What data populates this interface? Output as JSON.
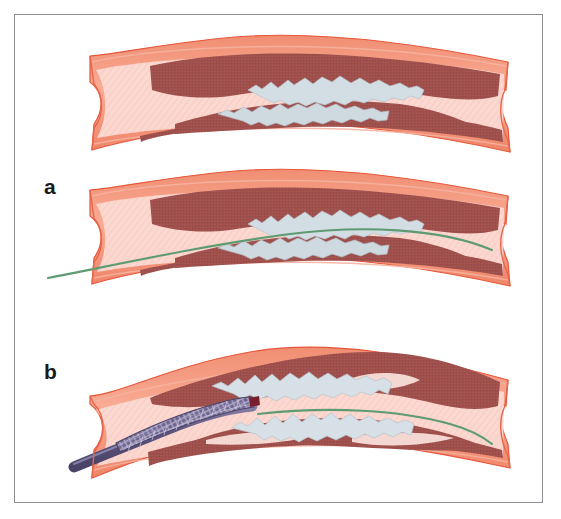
{
  "figure": {
    "border_color": "#8b8d90",
    "background_color": "#ffffff",
    "width": 561,
    "height": 519
  },
  "panels": [
    {
      "id": "a",
      "label": "a",
      "label_x": 44,
      "label_y": 176,
      "caption": "Stenosed artery and guidewire crossing the lesion",
      "sub_panels": [
        {
          "name": "stenosed-artery",
          "description": "Longitudinal cut-away of an atherosclerotic artery with calcified plaque narrowing the lumen",
          "guidewire": false,
          "device": "none"
        },
        {
          "name": "guidewire-crossing",
          "description": "Same artery with a guidewire advanced across the stenosis",
          "guidewire": true,
          "device": "guidewire"
        }
      ]
    },
    {
      "id": "b",
      "label": "b",
      "label_x": 44,
      "label_y": 361,
      "caption": "Stent delivery catheter advanced over the guidewire",
      "sub_panels": [
        {
          "name": "stent-delivery",
          "description": "Crimped stent on a delivery catheter tracked over the guidewire toward the lesion",
          "guidewire": true,
          "device": "stent-delivery-catheter"
        }
      ]
    }
  ],
  "anatomy": {
    "layers": [
      {
        "name": "adventitia",
        "label": "outer vessel wall",
        "color": "#f4836a"
      },
      {
        "name": "media",
        "label": "muscular media",
        "color": "#a0504c"
      },
      {
        "name": "intima-lumen",
        "label": "lumen",
        "color": "#fbd9d2"
      },
      {
        "name": "plaque",
        "label": "calcified atherosclerotic plaque",
        "color": "#cfd9e0"
      }
    ]
  },
  "devices": {
    "guidewire": {
      "name": "guidewire",
      "color": "#5f9b72",
      "width_px": 2
    },
    "catheter_shaft": {
      "name": "catheter-shaft",
      "color": "#6a6288"
    },
    "stent": {
      "name": "crimped-stent",
      "color": "#5b5478",
      "mesh_color": "#8d86a8"
    },
    "marker_band": {
      "name": "radiopaque-marker-band",
      "color": "#7a1f30"
    }
  },
  "vessels": [
    {
      "id": "vessel-top",
      "panel": "a",
      "x_start": 88,
      "x_end": 512,
      "y_center": 100,
      "has_guidewire": false,
      "has_stent": false
    },
    {
      "id": "vessel-middle",
      "panel": "a",
      "x_start": 88,
      "x_end": 512,
      "y_center": 232,
      "has_guidewire": true,
      "has_stent": false
    },
    {
      "id": "vessel-bottom",
      "panel": "b",
      "x_start": 88,
      "x_end": 512,
      "y_center": 412,
      "has_guidewire": true,
      "has_stent": true
    }
  ]
}
